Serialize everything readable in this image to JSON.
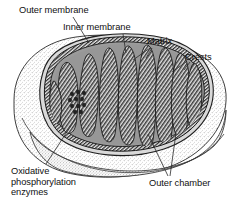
{
  "figure": {
    "width": 234,
    "height": 211,
    "background_color": "#ffffff",
    "line_color": "#111111",
    "text_color": "#111111"
  },
  "labels": {
    "outer_membrane": "Outer membrane",
    "inner_membrane": "Inner membrane",
    "matrix": "Matrix",
    "crests": "Crests",
    "outer_chamber": "Outer chamber",
    "oxidative_phosphorylation_enzymes": "Oxidative\nphosphorylation\nenzymes"
  },
  "structure": {
    "outer_body_fill": "#f2f2f2",
    "outer_body_stipple": "speckled-gray",
    "matrix_fill": "#9a9a9a",
    "matrix_inner_fill": "#8e8e8e",
    "cristae_fill": "#5a5a5a",
    "intermembrane_space_fill": "#d7d7d7",
    "membrane_stroke": "#1a1a1a",
    "crista_count": 9,
    "enzyme_granule_count": 11,
    "enzyme_granule_fill": "#2a2a2a"
  }
}
